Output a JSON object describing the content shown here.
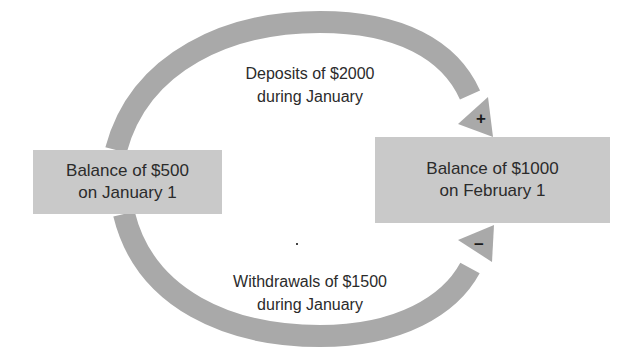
{
  "diagram": {
    "start_box": {
      "line1": "Balance of $500",
      "line2": "on January 1"
    },
    "end_box": {
      "line1": "Balance of $1000",
      "line2": "on February 1"
    },
    "top_flow": {
      "line1": "Deposits of $2000",
      "line2": "during January",
      "sign": "+"
    },
    "bottom_flow": {
      "line1": "Withdrawals of $1500",
      "line2": "during January",
      "sign": "−"
    }
  },
  "colors": {
    "arrow": "#a9a9a9",
    "box": "#c9c9c9",
    "text": "#2b2b2b"
  }
}
